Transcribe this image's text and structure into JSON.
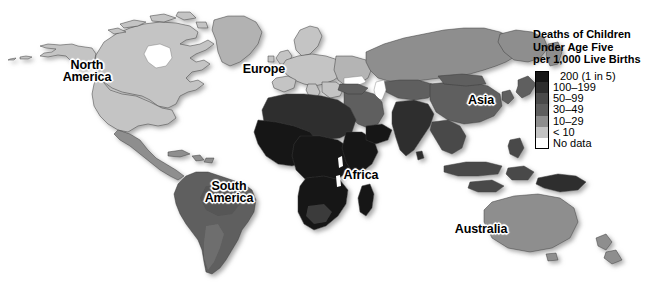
{
  "figure": {
    "kind": "choropleth-world-map",
    "background_color": "#ffffff"
  },
  "legend": {
    "title": "Deaths of Children\nUnder Age Five\nper 1,000 Live Births",
    "title_lines": [
      "Deaths of Children",
      "Under Age Five",
      "per 1,000 Live Births"
    ],
    "entries": [
      {
        "label": "200 (1 in 5)",
        "color": "#161616",
        "indent": true
      },
      {
        "label": "100–199",
        "color": "#2e2e2e",
        "indent": false
      },
      {
        "label": "50–99",
        "color": "#4a4a4a",
        "indent": false
      },
      {
        "label": "30–49",
        "color": "#5e5e5e",
        "indent": false
      },
      {
        "label": "10–29",
        "color": "#8e8e8e",
        "indent": false
      },
      {
        "label": "< 10",
        "color": "#c4c4c4",
        "indent": false
      },
      {
        "label": "No data",
        "color": "#ffffff",
        "indent": false
      }
    ]
  },
  "map_labels": [
    {
      "id": "north-america",
      "text": "North\nAmerica"
    },
    {
      "id": "south-america",
      "text": "South\nAmerica"
    },
    {
      "id": "europe",
      "text": "Europe"
    },
    {
      "id": "africa",
      "text": "Africa"
    },
    {
      "id": "asia",
      "text": "Asia"
    },
    {
      "id": "australia",
      "text": "Australia"
    }
  ],
  "chart_data": {
    "type": "heatmap",
    "title": "Deaths of Children Under Age Five per 1,000 Live Births",
    "xlabel": "",
    "ylabel": "",
    "legend_position": "top-right",
    "grid": false,
    "value_unit": "deaths per 1,000 live births",
    "classes": [
      {
        "label": "200 (1 in 5)",
        "min": 200,
        "max": null,
        "color": "#161616"
      },
      {
        "label": "100–199",
        "min": 100,
        "max": 199,
        "color": "#2e2e2e"
      },
      {
        "label": "50–99",
        "min": 50,
        "max": 99,
        "color": "#4a4a4a"
      },
      {
        "label": "30–49",
        "min": 30,
        "max": 49,
        "color": "#5e5e5e"
      },
      {
        "label": "10–29",
        "min": 10,
        "max": 29,
        "color": "#8e8e8e"
      },
      {
        "label": "< 10",
        "min": 0,
        "max": 9,
        "color": "#c4c4c4"
      },
      {
        "label": "No data",
        "min": null,
        "max": null,
        "color": "#ffffff"
      }
    ],
    "regions": [
      {
        "name": "North America",
        "class": "< 10"
      },
      {
        "name": "Greenland",
        "class": "< 10"
      },
      {
        "name": "Mexico / Central America",
        "class": "10–29"
      },
      {
        "name": "South America",
        "class": "30–49"
      },
      {
        "name": "Europe",
        "class": "< 10"
      },
      {
        "name": "Russia",
        "class": "10–29"
      },
      {
        "name": "North Africa",
        "class": "100–199"
      },
      {
        "name": "Sub-Saharan Africa",
        "class": "200 (1 in 5)"
      },
      {
        "name": "Middle East",
        "class": "30–49"
      },
      {
        "name": "South Asia / India",
        "class": "100–199"
      },
      {
        "name": "China",
        "class": "30–49"
      },
      {
        "name": "Southeast Asia",
        "class": "50–99"
      },
      {
        "name": "Australia",
        "class": "< 10"
      },
      {
        "name": "Antarctica",
        "class": "No data"
      }
    ]
  }
}
